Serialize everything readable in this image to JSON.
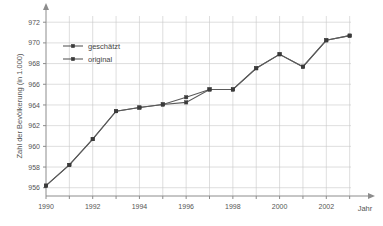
{
  "chart_data": {
    "type": "line",
    "title": "",
    "xlabel": "Jahr",
    "ylabel": "Zahl der Bevölkerung (in 1.000)",
    "x": [
      1990,
      1991,
      1992,
      1993,
      1994,
      1995,
      1996,
      1997,
      1998,
      1999,
      2000,
      2001,
      2002,
      2003
    ],
    "xlim": [
      1990,
      2003.4
    ],
    "ylim": [
      955.2,
      972.6
    ],
    "xticks": [
      1990,
      1991,
      1992,
      1993,
      1994,
      1995,
      1996,
      1997,
      1998,
      1999,
      2000,
      2001,
      2002,
      2003
    ],
    "xtick_labels": [
      "1990",
      "",
      "1992",
      "",
      "1994",
      "",
      "1996",
      "",
      "1998",
      "",
      "2000",
      "",
      "2002",
      ""
    ],
    "yticks": [
      956,
      958,
      960,
      962,
      964,
      966,
      968,
      970,
      972
    ],
    "ytick_labels": [
      "956",
      "958",
      "960",
      "962",
      "964",
      "966",
      "968",
      "970",
      "972"
    ],
    "grid": true,
    "legend_position": "upper left",
    "series": [
      {
        "name": "geschätzt",
        "marker": "square",
        "color": "#5a5a5a",
        "values": [
          956.2,
          958.2,
          960.7,
          963.4,
          963.75,
          964.05,
          964.75,
          965.5,
          965.5,
          967.55,
          968.9,
          967.7,
          970.25,
          970.7
        ]
      },
      {
        "name": "original",
        "marker": "square",
        "color": "#5a5a5a",
        "values": [
          956.2,
          958.2,
          960.7,
          963.4,
          963.75,
          964.05,
          964.25,
          965.5,
          965.5,
          967.55,
          968.9,
          967.7,
          970.25,
          970.7
        ]
      }
    ]
  },
  "legend": {
    "items": [
      {
        "label": "geschätzt"
      },
      {
        "label": "original"
      }
    ]
  },
  "axes": {
    "x_title": "Jahr",
    "y_title": "Zahl der Bevölkerung (in 1.000)"
  }
}
